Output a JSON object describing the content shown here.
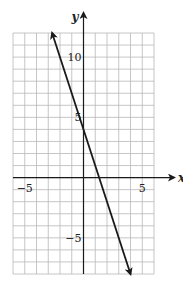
{
  "chart_data": {
    "type": "line",
    "title": "",
    "xlabel": "x",
    "ylabel": "y",
    "xlim": [
      -6,
      6
    ],
    "ylim": [
      -8,
      12
    ],
    "grid": true,
    "grid_step": 1,
    "x_ticks": [
      {
        "value": -5,
        "label": "−5"
      },
      {
        "value": 5,
        "label": "5"
      }
    ],
    "y_ticks": [
      {
        "value": 10,
        "label": "10"
      },
      {
        "value": 5,
        "label": "5"
      },
      {
        "value": -5,
        "label": "−5"
      }
    ],
    "series": [
      {
        "name": "y = -3x + 4",
        "slope": -3,
        "intercept": 4,
        "x": [
          -2.67,
          4
        ],
        "y": [
          12,
          -8
        ],
        "arrows": "both",
        "color": "#1a1a1a"
      }
    ]
  },
  "colors": {
    "grid": "#b8b8b8",
    "axis": "#1a1a1a",
    "line": "#1a1a1a"
  }
}
